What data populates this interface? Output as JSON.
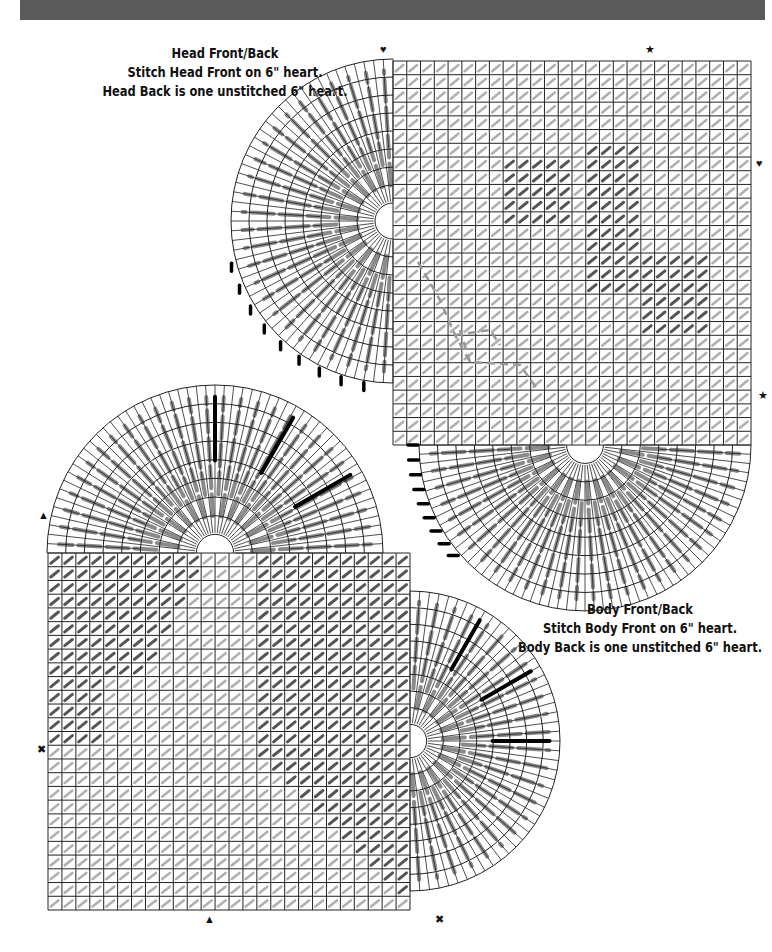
{
  "header_bar": {
    "color": "#5a5a5a"
  },
  "head_section": {
    "title": "Head Front/Back",
    "line1": "Stitch Head Front on 6\" heart.",
    "line2": "Head Back is one unstitched 6\" heart."
  },
  "body_section": {
    "title": "Body Front/Back",
    "line1": "Stitch Body Front on 6\" heart.",
    "line2": "Body Back is one unstitched 6\" heart."
  },
  "markers": {
    "heart": "♥",
    "star": "★",
    "triangle": "▲",
    "cross": "✖"
  },
  "colors": {
    "grid_line": "#222222",
    "stitch_gray": "#8a8a8a",
    "stitch_dark": "#555555",
    "accent_black": "#000000"
  },
  "legend": {
    "pieces": [
      "Head Front",
      "Head Back",
      "Body Front",
      "Body Back"
    ],
    "heart_size": "6\""
  }
}
